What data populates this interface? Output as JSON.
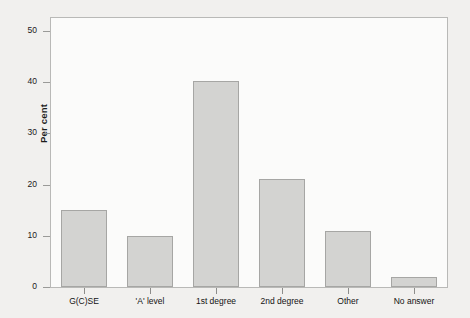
{
  "chart_data": {
    "type": "bar",
    "title": "",
    "xlabel": "",
    "ylabel": "Per cent",
    "categories": [
      "G(C)SE",
      "'A' level",
      "1st degree",
      "2nd degree",
      "Other",
      "No answer"
    ],
    "values": [
      15,
      10,
      40.3,
      21,
      11,
      2
    ],
    "ylim": [
      0,
      52.5
    ],
    "yticks": [
      0,
      10,
      20,
      30,
      40,
      50
    ],
    "ytick_labels": [
      "0",
      "10",
      "20",
      "30",
      "40",
      "50"
    ],
    "grid": false,
    "legend": null,
    "bar_color": "#d3d3d1",
    "bar_edge_color": "#a6a6a4",
    "frame_color": "#b9b9b7",
    "plot_background": "#fbfbfa",
    "page_background": "#f1f0ee"
  }
}
